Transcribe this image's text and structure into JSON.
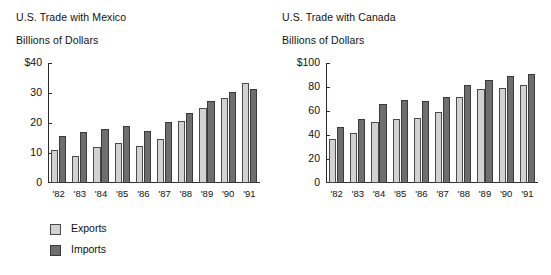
{
  "chart_data": [
    {
      "id": "mexico",
      "type": "bar",
      "title": "U.S. Trade with Mexico",
      "subtitle": "Billions of Dollars",
      "xlabel": "",
      "ylabel": "Billions of Dollars",
      "categories": [
        "'82",
        "'83",
        "'84",
        "'85",
        "'86",
        "'87",
        "'88",
        "'89",
        "'90",
        "'91"
      ],
      "ylim": [
        0,
        40
      ],
      "ytick_values": [
        40,
        30,
        20,
        10,
        0
      ],
      "ytick_labels": [
        "$40",
        "30",
        "20",
        "10",
        "0"
      ],
      "grid": false,
      "legend_position": "below-left",
      "series": [
        {
          "name": "Exports",
          "color": "#d2d2d2",
          "values": [
            11.0,
            9.0,
            12.0,
            13.5,
            12.4,
            14.6,
            20.6,
            25.0,
            28.4,
            33.3
          ]
        },
        {
          "name": "Imports",
          "color": "#6e6e6e",
          "values": [
            15.6,
            17.0,
            18.0,
            19.1,
            17.3,
            20.3,
            23.3,
            27.2,
            30.2,
            31.2
          ]
        }
      ]
    },
    {
      "id": "canada",
      "type": "bar",
      "title": "U.S. Trade with Canada",
      "subtitle": "Billions of Dollars",
      "xlabel": "",
      "ylabel": "Billions of Dollars",
      "categories": [
        "'82",
        "'83",
        "'84",
        "'85",
        "'86",
        "'87",
        "'88",
        "'89",
        "'90",
        "'91"
      ],
      "ylim": [
        0,
        100
      ],
      "ytick_values": [
        100,
        80,
        60,
        40,
        20,
        0
      ],
      "ytick_labels": [
        "$100",
        "80",
        "60",
        "40",
        "20",
        "0"
      ],
      "grid": false,
      "legend_position": "below-left",
      "series": [
        {
          "name": "Exports",
          "color": "#d2d2d2",
          "values": [
            37.0,
            42.0,
            51.0,
            53.5,
            54.0,
            59.5,
            72.0,
            78.0,
            79.5,
            81.5
          ]
        },
        {
          "name": "Imports",
          "color": "#6e6e6e",
          "values": [
            47.0,
            53.0,
            66.0,
            69.0,
            68.0,
            71.5,
            82.0,
            85.5,
            89.5,
            90.5
          ]
        }
      ]
    }
  ],
  "legend": {
    "items": [
      {
        "label": "Exports",
        "swatch": "exports"
      },
      {
        "label": "Imports",
        "swatch": "imports"
      }
    ]
  }
}
